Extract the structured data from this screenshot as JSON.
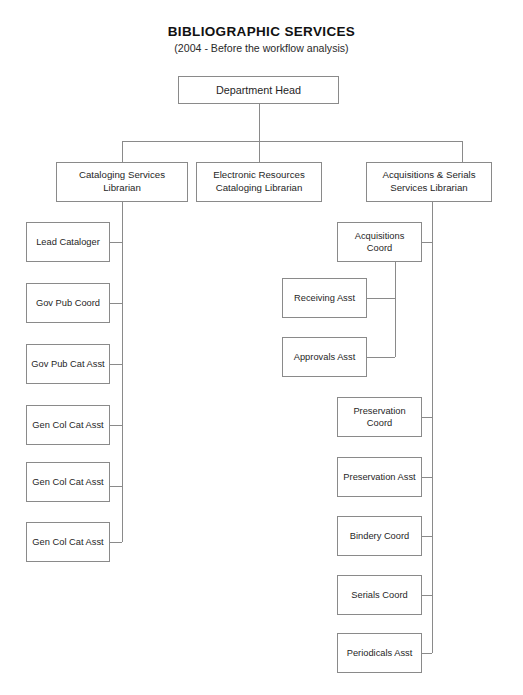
{
  "header": {
    "title": "BIBLIOGRAPHIC SERVICES",
    "subtitle": "(2004 - Before the workflow analysis)"
  },
  "root": {
    "label": "Department Head"
  },
  "tier2": [
    {
      "label": "Cataloging Services Librarian"
    },
    {
      "label": "Electronic Resources Cataloging Librarian"
    },
    {
      "label": "Acquisitions & Serials Services Librarian"
    }
  ],
  "cataloging_reports": [
    {
      "label": "Lead Cataloger"
    },
    {
      "label": "Gov Pub Coord"
    },
    {
      "label": "Gov Pub Cat Asst"
    },
    {
      "label": "Gen Col Cat Asst"
    },
    {
      "label": "Gen Col Cat Asst"
    },
    {
      "label": "Gen Col Cat Asst"
    }
  ],
  "acquisitions_reports": [
    {
      "label": "Acquisitions Coord"
    },
    {
      "label": "Preservation Coord"
    },
    {
      "label": "Preservation Asst"
    },
    {
      "label": "Bindery Coord"
    },
    {
      "label": "Serials Coord"
    },
    {
      "label": "Periodicals Asst"
    }
  ],
  "acquisitions_coord_reports": [
    {
      "label": "Receiving Asst"
    },
    {
      "label": "Approvals Asst"
    }
  ],
  "colors": {
    "line": "#8a8a8a",
    "box_border": "#8a8a8a",
    "text": "#1f1f1f",
    "background": "#ffffff"
  }
}
